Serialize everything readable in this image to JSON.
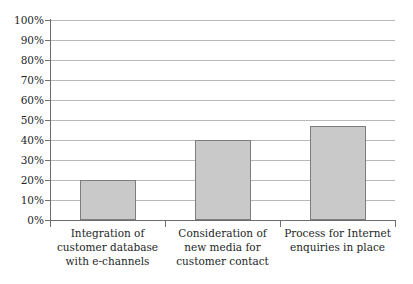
{
  "chart_data": {
    "type": "bar",
    "title": "",
    "subtitle": "",
    "xlabel": "",
    "ylabel": "",
    "ylim": [
      0,
      100
    ],
    "y_unit": "%",
    "grid": true,
    "legend": "none",
    "categories": [
      "Integration of customer database with e-channels",
      "Consideration of new media for customer contact",
      "Process for Internet enquiries in place"
    ],
    "category_lines": [
      [
        "Integration of",
        "customer database",
        "with e-channels"
      ],
      [
        "Consideration of",
        "new media for",
        "customer contact"
      ],
      [
        "Process for Internet",
        "enquiries in place"
      ]
    ],
    "values": [
      20,
      40,
      47
    ],
    "ytick_labels": [
      "100%",
      "90%",
      "80%",
      "70%",
      "60%",
      "50%",
      "40%",
      "30%",
      "20%",
      "10%",
      "0%"
    ],
    "ytick_values": [
      100,
      90,
      80,
      70,
      60,
      50,
      40,
      30,
      20,
      10,
      0
    ],
    "colors": {
      "bar_fill": "#c9c9c9",
      "bar_border": "#7d7d7d",
      "gridline": "#b9b9b9",
      "axis": "#6e6e6e",
      "text": "#231f1f",
      "background": "#ffffff"
    }
  }
}
